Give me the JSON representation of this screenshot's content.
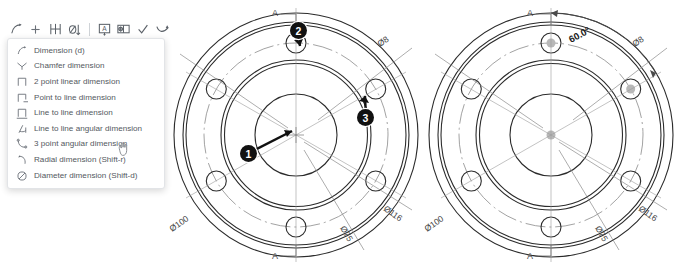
{
  "toolbar": {
    "name": "dimension-toolbar",
    "buttons": [
      {
        "id": "dimension",
        "icon": "dimension-icon",
        "label": "Dimension"
      },
      {
        "id": "add",
        "icon": "plus-icon",
        "label": "Add"
      },
      {
        "id": "linear-dimension",
        "icon": "linear-dimension-icon",
        "label": "Linear dimension"
      },
      {
        "id": "diameter",
        "icon": "diameter-dimension-icon",
        "label": "Diameter dimension"
      },
      {
        "id": "text-note",
        "icon": "text-note-icon",
        "label": "Note"
      },
      {
        "id": "feature-frame",
        "icon": "feature-control-frame-icon",
        "label": "Feature control frame"
      },
      {
        "id": "accept",
        "icon": "checkmark-icon",
        "label": "Accept"
      },
      {
        "id": "leader",
        "icon": "leader-line-icon",
        "label": "Leader"
      }
    ]
  },
  "menu": {
    "name": "dimension-dropdown-menu",
    "items": [
      {
        "icon": "dimension-icon",
        "label": "Dimension (d)"
      },
      {
        "icon": "chamfer-dimension-icon",
        "label": "Chamfer dimension"
      },
      {
        "icon": "two-point-linear-icon",
        "label": "2 point linear dimension"
      },
      {
        "icon": "point-to-line-icon",
        "label": "Point to line dimension"
      },
      {
        "icon": "line-to-line-icon",
        "label": "Line to line dimension"
      },
      {
        "icon": "line-to-line-angular-icon",
        "label": "Line to line angular dimension"
      },
      {
        "icon": "three-point-angular-icon",
        "label": "3 point angular dimension"
      },
      {
        "icon": "radial-dimension-icon",
        "label": "Radial dimension (Shift-r)"
      },
      {
        "icon": "diameter-dimension-icon",
        "label": "Diameter dimension (Shift-d)"
      }
    ],
    "hovered_index": 6
  },
  "callouts": [
    {
      "number": "1",
      "target": "center-point"
    },
    {
      "number": "2",
      "target": "top-bolt-hole"
    },
    {
      "number": "3",
      "target": "upper-right-bolt-hole"
    }
  ],
  "drawing_left": {
    "name": "flange-drawing-before",
    "section_label_top": "A",
    "section_label_bottom": "A",
    "dimensions": [
      {
        "id": "od",
        "label": "Ø100"
      },
      {
        "id": "bolt-hole",
        "label": "Ø8"
      },
      {
        "id": "outer",
        "label": "Ø116"
      },
      {
        "id": "bolt-circle",
        "label": "Ø75"
      }
    ]
  },
  "drawing_right": {
    "name": "flange-drawing-after",
    "section_label_top": "A",
    "section_label_bottom": "A",
    "dimensions": [
      {
        "id": "od",
        "label": "Ø100"
      },
      {
        "id": "bolt-hole",
        "label": "Ø8"
      },
      {
        "id": "outer",
        "label": "Ø116"
      },
      {
        "id": "bolt-circle",
        "label": "Ø75"
      },
      {
        "id": "angular",
        "label": "60.0°"
      }
    ]
  },
  "colors": {
    "line": "#2b2b2b",
    "thin_line": "#8a8a8a",
    "badge_bg": "#111111",
    "badge_fg": "#ffffff",
    "menu_text": "#53585e",
    "background": "#ffffff"
  }
}
